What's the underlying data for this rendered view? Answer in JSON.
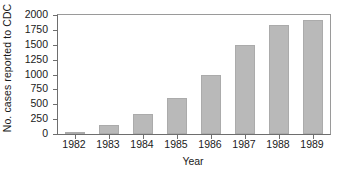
{
  "chart_data": {
    "type": "bar",
    "title": "",
    "xlabel": "Year",
    "ylabel": "No. cases reported to CDC",
    "categories": [
      "1982",
      "1983",
      "1984",
      "1985",
      "1986",
      "1987",
      "1988",
      "1989"
    ],
    "values": [
      30,
      150,
      335,
      605,
      995,
      1495,
      1830,
      1915
    ],
    "ylim": [
      0,
      2000
    ],
    "yticks": [
      0,
      250,
      500,
      750,
      1000,
      1250,
      1500,
      1750,
      2000
    ],
    "ytick_labels": [
      "0",
      "250",
      "500",
      "750",
      "1000",
      "1250",
      "1500",
      "1750",
      "2000"
    ],
    "grid": false,
    "legend": null,
    "bar_color": "#b9b9b9",
    "axis_color": "#6e6e6e",
    "text_color": "#1a1a1a"
  }
}
